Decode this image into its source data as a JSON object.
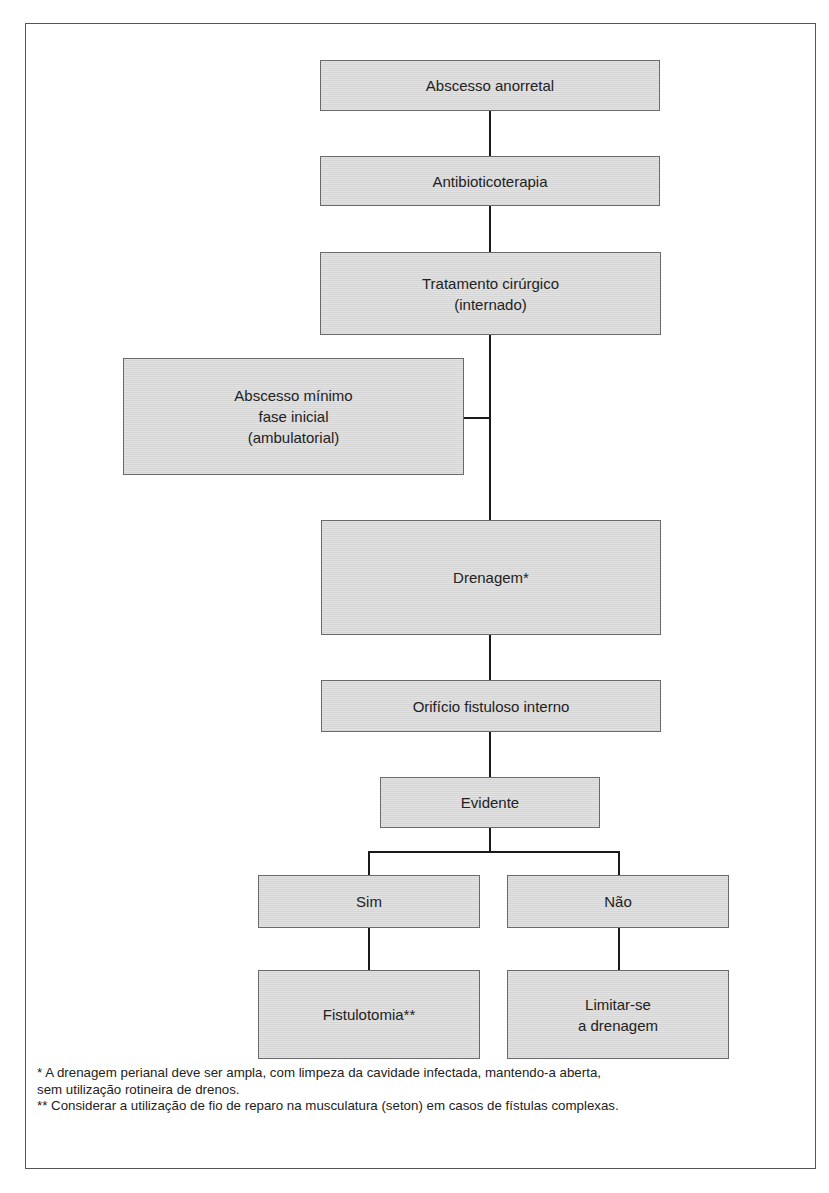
{
  "flowchart": {
    "nodes": {
      "abscesso": "Abscesso anorretal",
      "antibiotico": "Antibioticoterapia",
      "tratamento": "Tratamento cirúrgico\n(internado)",
      "minimo": "Abscesso mínimo\nfase inicial\n(ambulatorial)",
      "drenagem": "Drenagem*",
      "orificio": "Orifício fistuloso interno",
      "evidente": "Evidente",
      "sim": "Sim",
      "nao": "Não",
      "fistulotomia": "Fistulotomia**",
      "limitar": "Limitar-se\na drenagem"
    },
    "edges": [
      [
        "Abscesso anorretal",
        "Antibioticoterapia"
      ],
      [
        "Antibioticoterapia",
        "Tratamento cirúrgico (internado)"
      ],
      [
        "Tratamento cirúrgico (internado)",
        "Drenagem*"
      ],
      [
        "Abscesso mínimo fase inicial (ambulatorial)",
        "Drenagem*"
      ],
      [
        "Drenagem*",
        "Orifício fistuloso interno"
      ],
      [
        "Orifício fistuloso interno",
        "Evidente"
      ],
      [
        "Evidente",
        "Sim"
      ],
      [
        "Evidente",
        "Não"
      ],
      [
        "Sim",
        "Fistulotomia**"
      ],
      [
        "Não",
        "Limitar-se a drenagem"
      ]
    ]
  },
  "footnotes": {
    "note1_line1": "*  A drenagem perianal deve ser ampla, com limpeza da cavidade infectada, mantendo-a aberta,",
    "note1_line2": "sem utilização rotineira de drenos.",
    "note2": "** Considerar a utilização de fio de reparo na musculatura (seton) em casos de fístulas complexas."
  },
  "colors": {
    "box_fill": "#dcdcdc",
    "box_border": "#6a6a6a",
    "line": "#1a1a1a",
    "frame_border": "#555555"
  }
}
